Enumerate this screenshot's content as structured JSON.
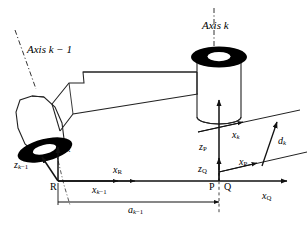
{
  "figure": {
    "background_color": "#ffffff",
    "stroke_color": "#1a1a1a",
    "fill_black": "#000000"
  },
  "axis_labels": {
    "axis_k": "Axis k",
    "axis_k_minus_1": "Axis k − 1"
  },
  "frame_points": {
    "R": "R",
    "P": "P",
    "Q": "Q"
  },
  "vectors": {
    "z_R": {
      "base": "z",
      "sub": "R"
    },
    "z_k_minus_1": {
      "base": "z",
      "sub": "k−1"
    },
    "x_R": {
      "base": "x",
      "sub": "R"
    },
    "x_k_minus_1": {
      "base": "x",
      "sub": "k−1"
    },
    "z_P": {
      "base": "z",
      "sub": "P"
    },
    "z_Q": {
      "base": "z",
      "sub": "Q"
    },
    "x_P": {
      "base": "x",
      "sub": "P"
    },
    "x_Q": {
      "base": "x",
      "sub": "Q"
    },
    "x_k": {
      "base": "x",
      "sub": "k"
    }
  },
  "dimensions": {
    "a_k_minus_1": {
      "base": "a",
      "sub": "k−1"
    },
    "d_k": {
      "base": "d",
      "sub": "k"
    }
  },
  "components": {
    "joint_cylinder_left": "joint-cylinder-k-minus-1",
    "joint_cylinder_right": "joint-cylinder-k",
    "link_arm": "link-arm",
    "baseline": "common-normal-baseline"
  }
}
